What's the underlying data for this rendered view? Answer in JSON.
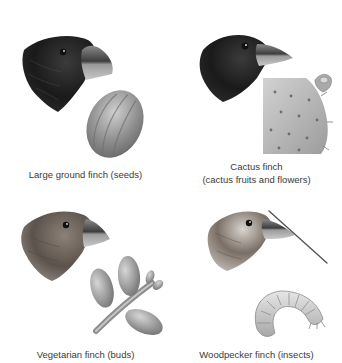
{
  "figure": {
    "panels": [
      {
        "id": "large-ground-finch",
        "caption_lines": [
          "Large ground finch (seeds)"
        ],
        "bird_icon": "finch-head-large-beak",
        "food_icon": "seed",
        "food": "seeds"
      },
      {
        "id": "cactus-finch",
        "caption_lines": [
          "Cactus finch",
          "(cactus fruits and flowers)"
        ],
        "bird_icon": "finch-head-long-pointed-beak",
        "food_icon": "cactus-pad",
        "food": "cactus fruits and flowers"
      },
      {
        "id": "vegetarian-finch",
        "caption_lines": [
          "Vegetarian finch (buds)"
        ],
        "bird_icon": "finch-head-short-curved-beak",
        "food_icon": "buds-twig",
        "food": "buds"
      },
      {
        "id": "woodpecker-finch",
        "caption_lines": [
          "Woodpecker finch (insects)"
        ],
        "bird_icon": "finch-head-with-twig-tool",
        "food_icon": "grub",
        "food": "insects"
      }
    ]
  },
  "colors": {
    "background": "#ffffff",
    "caption_text": "#3a3a3a",
    "dark_plumage": "#1c1c1c",
    "brown_plumage": "#5a5048",
    "beak": "#6e6e6e",
    "food_gray": "#9a9a9a"
  }
}
